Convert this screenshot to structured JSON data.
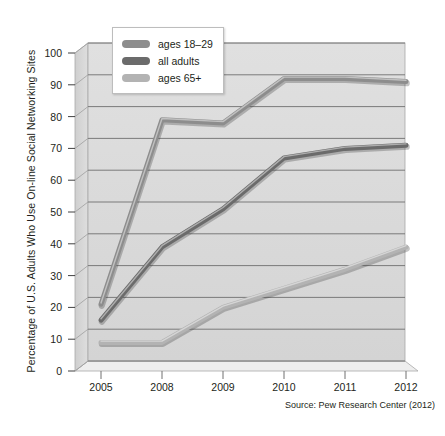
{
  "chart_data": {
    "type": "line",
    "title": "",
    "xlabel": "",
    "ylabel": "Percentage of U.S. Adults Who Use On-line Social Networking Sites",
    "categories": [
      "2005",
      "2008",
      "2009",
      "2010",
      "2011",
      "2012"
    ],
    "ylim": [
      0,
      100
    ],
    "ytick_values": [
      0,
      10,
      20,
      30,
      40,
      50,
      60,
      70,
      80,
      90,
      100
    ],
    "ytick_labels": [
      "0",
      "10",
      "20",
      "30",
      "40",
      "50",
      "60",
      "70",
      "80",
      "90",
      "100"
    ],
    "grid": true,
    "legend_position": "top-left-inside",
    "series": [
      {
        "name": "ages 18–29",
        "color": "#8d8d8d",
        "values": [
          21,
          79,
          78,
          92,
          92,
          91
        ]
      },
      {
        "name": "all adults",
        "color": "#6b6b6b",
        "values": [
          16,
          39,
          51,
          67,
          70,
          71
        ]
      },
      {
        "name": "ages 65+",
        "color": "#b3b3b3",
        "values": [
          9,
          9,
          20,
          26,
          32,
          39
        ]
      }
    ],
    "source": "Source: Pew Research Center (2012)"
  },
  "legend": {
    "items": [
      {
        "label": "ages 18–29"
      },
      {
        "label": "all adults"
      },
      {
        "label": "ages 65+"
      }
    ]
  },
  "axes": {
    "y_title": "Percentage of U.S. Adults Who Use On-line Social Networking Sites",
    "y_labels": [
      "100",
      "90",
      "80",
      "70",
      "60",
      "50",
      "40",
      "30",
      "20",
      "10",
      "0"
    ],
    "x_labels": [
      "2005",
      "2008",
      "2009",
      "2010",
      "2011",
      "2012"
    ]
  },
  "footer": {
    "source": "Source: Pew Research Center (2012)"
  },
  "colors": {
    "plot_face": "#d9d9d9",
    "plot_face_top": "#e2e2e2",
    "grid": "#6f6f6f",
    "frame": "#9a9a9a",
    "series_18_29": "#8d8d8d",
    "series_all": "#6b6b6b",
    "series_65": "#b3b3b3"
  }
}
